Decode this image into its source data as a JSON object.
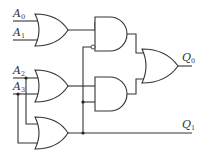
{
  "diagram": {
    "type": "logic-circuit",
    "inputs": [
      {
        "id": "A0",
        "letter": "A",
        "sub": "0"
      },
      {
        "id": "A1",
        "letter": "A",
        "sub": "1"
      },
      {
        "id": "A2",
        "letter": "A",
        "sub": "2"
      },
      {
        "id": "A3",
        "letter": "A",
        "sub": "3"
      }
    ],
    "outputs": [
      {
        "id": "Q0",
        "letter": "Q",
        "sub": "0"
      },
      {
        "id": "Q1",
        "letter": "Q",
        "sub": "1"
      }
    ],
    "gates": [
      {
        "id": "or1",
        "type": "OR",
        "inputs": [
          "A0",
          "A1"
        ]
      },
      {
        "id": "or2",
        "type": "OR",
        "inputs": [
          "A2",
          "A3"
        ]
      },
      {
        "id": "or3",
        "type": "OR",
        "inputs": [
          "A2",
          "A3"
        ]
      },
      {
        "id": "and1",
        "type": "AND",
        "inputs": [
          "or1",
          "NOT or3"
        ]
      },
      {
        "id": "and2",
        "type": "AND",
        "inputs": [
          "or2",
          "or3"
        ]
      },
      {
        "id": "or4",
        "type": "OR",
        "inputs": [
          "and1",
          "and2"
        ],
        "output": "Q0"
      }
    ],
    "direct_outputs": [
      {
        "from": "or3",
        "to": "Q1"
      }
    ],
    "colors": {
      "line": "#333333",
      "background": "#ffffff"
    }
  }
}
